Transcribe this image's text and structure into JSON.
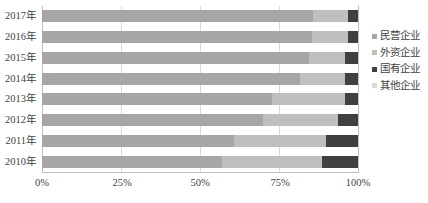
{
  "chart_data": {
    "type": "bar",
    "orientation": "horizontal",
    "stacked": true,
    "normalized": true,
    "title": "",
    "xlabel": "",
    "ylabel": "",
    "xlim": [
      0,
      100
    ],
    "xtick_labels": [
      "0%",
      "25%",
      "50%",
      "75%",
      "100%"
    ],
    "xtick_values": [
      0,
      25,
      50,
      75,
      100
    ],
    "grid": true,
    "grid_axis": "x",
    "legend_position": "right",
    "categories": [
      "2010年",
      "2011年",
      "2012年",
      "2013年",
      "2014年",
      "2015年",
      "2016年",
      "2017年"
    ],
    "series": [
      {
        "name": "民营企业",
        "color": "#a6a6a6",
        "values": [
          57.0,
          60.8,
          70.0,
          72.8,
          81.6,
          84.5,
          85.4,
          85.8
        ]
      },
      {
        "name": "外资企业",
        "color": "#bfbfbf",
        "values": [
          31.6,
          29.2,
          23.7,
          23.1,
          14.3,
          11.4,
          11.4,
          11.0
        ]
      },
      {
        "name": "国有企业",
        "color": "#404040",
        "values": [
          11.4,
          10.0,
          6.3,
          4.1,
          4.1,
          4.1,
          3.2,
          3.2
        ]
      },
      {
        "name": "其他企业",
        "color": "#d9d9d9",
        "values": [
          0.0,
          0.0,
          0.0,
          0.0,
          0.0,
          0.0,
          0.0,
          0.0
        ]
      }
    ]
  },
  "legend": {
    "items": [
      {
        "label": "民营企业",
        "color": "#a6a6a6"
      },
      {
        "label": "外资企业",
        "color": "#bfbfbf"
      },
      {
        "label": "国有企业",
        "color": "#404040"
      },
      {
        "label": "其他企业",
        "color": "#d9d9d9"
      }
    ]
  },
  "axis": {
    "x_ticks": [
      "0%",
      "25%",
      "50%",
      "75%",
      "100%"
    ],
    "y_ticks": [
      "2017年",
      "2016年",
      "2015年",
      "2014年",
      "2013年",
      "2012年",
      "2011年",
      "2010年"
    ]
  }
}
